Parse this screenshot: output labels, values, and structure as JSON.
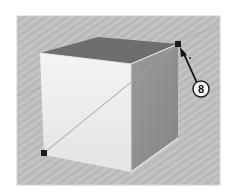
{
  "diagram": {
    "callouts": [
      {
        "label": "8",
        "target": "top-right-back vertex"
      }
    ],
    "markers": [
      {
        "name": "endpoint-top-right",
        "x": 178,
        "y": 44
      },
      {
        "name": "endpoint-bottom-left",
        "x": 44,
        "y": 153
      }
    ],
    "colors": {
      "background": "#b9b9b9",
      "stripe": "#c6c6c6",
      "top_face": "#6e6e6e",
      "front_face": "#efefef",
      "right_face": "#8e8e8e",
      "edge": "#d8d8d8",
      "marker": "#1a1a1a",
      "callout_fill": "#ffffff",
      "callout_stroke": "#222222"
    }
  }
}
